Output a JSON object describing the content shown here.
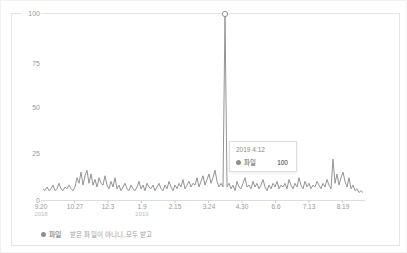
{
  "chart": {
    "y_axis": {
      "ticks": [
        "100",
        "75",
        "50",
        "25",
        "0"
      ]
    },
    "x_axis": {
      "ticks": [
        {
          "label": "9.20",
          "year": "2018"
        },
        {
          "label": "10.27",
          "year": ""
        },
        {
          "label": "12.3",
          "year": ""
        },
        {
          "label": "1.9",
          "year": "2019"
        },
        {
          "label": "2.15",
          "year": ""
        },
        {
          "label": "3.24",
          "year": ""
        },
        {
          "label": "4.30",
          "year": ""
        },
        {
          "label": "6.6",
          "year": ""
        },
        {
          "label": "7.13",
          "year": ""
        },
        {
          "label": "8.19",
          "year": ""
        }
      ]
    },
    "tooltip": {
      "date": "2019 4.12",
      "series": "파일",
      "value": "100"
    },
    "legend": {
      "keyword": "파일",
      "terms": "받은 파일이 아니니,모두 받고"
    },
    "colors": {
      "line": "#949494",
      "axis": "#dddddd",
      "tick": "#cccccc",
      "label": "#999999",
      "year_label": "#c0c0c0",
      "marker_stroke": "#8f8f8f"
    }
  },
  "chart_data": {
    "type": "line",
    "title": "",
    "xlabel": "",
    "ylabel": "",
    "ylim": [
      0,
      100
    ],
    "y_ticks": [
      0,
      25,
      50,
      75,
      100
    ],
    "x_tick_labels": [
      "9.20",
      "10.27",
      "12.3",
      "1.9",
      "2.15",
      "3.24",
      "4.30",
      "6.6",
      "7.13",
      "8.19"
    ],
    "x_tick_years": {
      "9.20": "2018",
      "1.9": "2019"
    },
    "grid": "top-line-only",
    "legend_position": "bottom-left",
    "peak": {
      "date": "2019 4.12",
      "value": 100,
      "marker": "open-circle"
    },
    "secondary_peak": {
      "approx_date": "8.12",
      "value": 22
    },
    "series": [
      {
        "name": "파일",
        "values": [
          6,
          5,
          7,
          5,
          6,
          8,
          5,
          6,
          9,
          6,
          5,
          7,
          6,
          8,
          6,
          5,
          7,
          12,
          9,
          15,
          8,
          13,
          16,
          9,
          14,
          8,
          11,
          7,
          12,
          9,
          8,
          13,
          8,
          6,
          10,
          7,
          12,
          6,
          8,
          5,
          7,
          9,
          6,
          5,
          8,
          6,
          5,
          7,
          10,
          6,
          8,
          5,
          9,
          7,
          6,
          8,
          5,
          7,
          9,
          6,
          5,
          8,
          6,
          10,
          7,
          5,
          8,
          6,
          9,
          7,
          11,
          6,
          8,
          10,
          7,
          9,
          8,
          12,
          7,
          10,
          13,
          8,
          11,
          14,
          9,
          12,
          16,
          10,
          7,
          9,
          7,
          100,
          7,
          9,
          6,
          8,
          5,
          10,
          7,
          6,
          9,
          12,
          7,
          8,
          6,
          10,
          7,
          9,
          6,
          8,
          11,
          7,
          5,
          8,
          6,
          9,
          7,
          10,
          6,
          8,
          7,
          9,
          6,
          11,
          8,
          6,
          9,
          7,
          12,
          8,
          6,
          10,
          7,
          9,
          6,
          8,
          7,
          10,
          8,
          6,
          9,
          7,
          11,
          8,
          6,
          22,
          9,
          14,
          8,
          12,
          15,
          10,
          7,
          12,
          6,
          8,
          5,
          6,
          4,
          5,
          4
        ]
      }
    ]
  }
}
